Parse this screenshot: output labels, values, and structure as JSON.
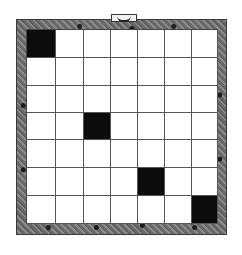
{
  "board": {
    "rows": 7,
    "cols": 7,
    "filled_cells": [
      {
        "row": 0,
        "col": 0
      },
      {
        "row": 3,
        "col": 2
      },
      {
        "row": 5,
        "col": 4
      },
      {
        "row": 6,
        "col": 6
      }
    ],
    "colors": {
      "filled": "#0c0c0c",
      "empty": "#ffffff",
      "frame": "#6e6e6e",
      "grid_line": "#555555"
    }
  },
  "frame_tab": {
    "icon": "banner-tab-icon"
  }
}
